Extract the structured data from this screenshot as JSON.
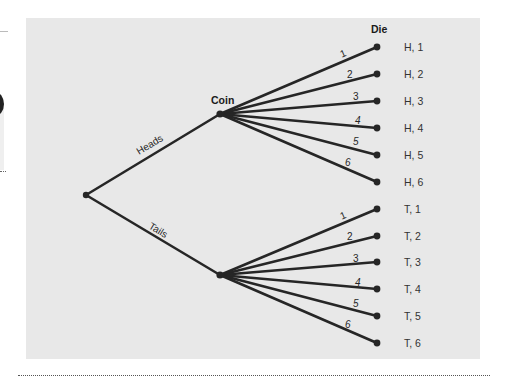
{
  "diagram": {
    "type": "tree-diagram",
    "colors": {
      "panel": "#e8e8e8",
      "line": "#262626",
      "label": "#333333"
    },
    "stage_labels": {
      "coin": "Coin",
      "die": "Die"
    },
    "branches": {
      "heads": "Heads",
      "tails": "Tails"
    },
    "die_faces": [
      "1",
      "2",
      "3",
      "4",
      "5",
      "6"
    ],
    "outcomes": {
      "heads": [
        "H, 1",
        "H, 2",
        "H, 3",
        "H, 4",
        "H, 5",
        "H, 6"
      ],
      "tails": [
        "T, 1",
        "T, 2",
        "T, 3",
        "T, 4",
        "T, 5",
        "T, 6"
      ]
    }
  }
}
